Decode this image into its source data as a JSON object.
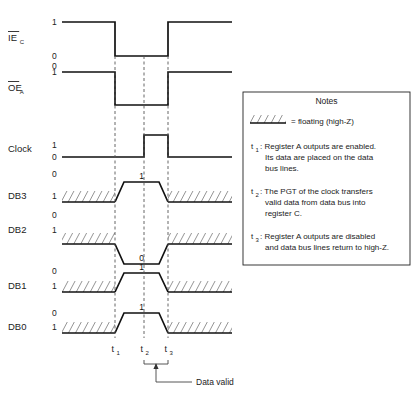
{
  "diagram": {
    "type": "timing-diagram",
    "time_axis": {
      "markers": [
        {
          "id": "t1",
          "label": "t",
          "sub": "1",
          "x": 115
        },
        {
          "id": "t2",
          "label": "t",
          "sub": "2",
          "x": 144
        },
        {
          "id": "t3",
          "label": "t",
          "sub": "3",
          "x": 168
        }
      ],
      "plot_x_start": 62,
      "plot_x_end": 232
    },
    "data_valid": {
      "label": "Data valid",
      "from_marker": "t2",
      "to_marker": "t3"
    },
    "signals": [
      {
        "name": "IEC",
        "label": "IE",
        "subscript": "C",
        "overline": true,
        "levels": [
          "1",
          "0"
        ],
        "level_top": "1",
        "level_bottom": "0",
        "kind": "logic",
        "segments": [
          {
            "level": "high",
            "from": 62,
            "to": 115
          },
          {
            "level": "low",
            "from": 115,
            "to": 168
          },
          {
            "level": "high",
            "from": 168,
            "to": 232
          }
        ]
      },
      {
        "name": "OEA",
        "label": "OE",
        "subscript": "A",
        "overline": true,
        "levels": [
          "1",
          "0"
        ],
        "level_top": "1",
        "level_bottom": "0",
        "kind": "logic",
        "segments": [
          {
            "level": "high",
            "from": 62,
            "to": 115
          },
          {
            "level": "low",
            "from": 115,
            "to": 168
          },
          {
            "level": "high",
            "from": 168,
            "to": 232
          }
        ]
      },
      {
        "name": "Clock",
        "label": "Clock",
        "subscript": "",
        "overline": false,
        "levels": [
          "1",
          "0"
        ],
        "level_top": "1",
        "level_bottom": "0",
        "kind": "logic",
        "segments": [
          {
            "level": "low",
            "from": 62,
            "to": 144
          },
          {
            "level": "high",
            "from": 144,
            "to": 168
          },
          {
            "level": "low",
            "from": 168,
            "to": 232
          }
        ]
      },
      {
        "name": "DB3",
        "label": "DB3",
        "subscript": "",
        "overline": false,
        "levels": [
          "1",
          "0"
        ],
        "level_top": "1",
        "level_bottom": "0",
        "kind": "bus",
        "value": "1",
        "value_level": "high",
        "float_left": {
          "from": 62,
          "to": 115
        },
        "float_right": {
          "from": 168,
          "to": 232
        }
      },
      {
        "name": "DB2",
        "label": "DB2",
        "subscript": "",
        "overline": false,
        "levels": [
          "1",
          "0"
        ],
        "level_top": "1",
        "level_bottom": "0",
        "kind": "bus",
        "value": "0",
        "value_level": "low",
        "float_left": {
          "from": 62,
          "to": 115
        },
        "float_right": {
          "from": 168,
          "to": 232
        }
      },
      {
        "name": "DB1",
        "label": "DB1",
        "subscript": "",
        "overline": false,
        "levels": [
          "1",
          "0"
        ],
        "level_top": "1",
        "level_bottom": "0",
        "kind": "bus",
        "value": "1",
        "value_level": "high",
        "float_left": {
          "from": 62,
          "to": 115
        },
        "float_right": {
          "from": 168,
          "to": 232
        }
      },
      {
        "name": "DB0",
        "label": "DB0",
        "subscript": "",
        "overline": false,
        "levels": [
          "1",
          "0"
        ],
        "level_top": "1",
        "level_bottom": "0",
        "kind": "bus",
        "value": "1",
        "value_level": "high",
        "float_left": {
          "from": 62,
          "to": 115
        },
        "float_right": {
          "from": 168,
          "to": 232
        }
      }
    ]
  },
  "notes": {
    "title": "Notes",
    "legend": {
      "symbol": "hatch-floating-icon",
      "text": "= floating (high-Z)"
    },
    "items": [
      {
        "marker": "t",
        "sub": "1",
        "lines": [
          ": Register A outputs are enabled.",
          "Its data are placed on the data",
          "bus lines."
        ]
      },
      {
        "marker": "t",
        "sub": "2",
        "lines": [
          ": The PGT of the clock transfers",
          "valid data from data bus into",
          "register C."
        ]
      },
      {
        "marker": "t",
        "sub": "3",
        "lines": [
          ": Register A outputs are disabled",
          "and data bus lines return to high-Z."
        ]
      }
    ]
  },
  "caption": {
    "text": ""
  },
  "colors": {
    "signal": "#111111",
    "dashed": "#555555",
    "box": "#222222",
    "text": "#222222",
    "background": "#ffffff"
  }
}
